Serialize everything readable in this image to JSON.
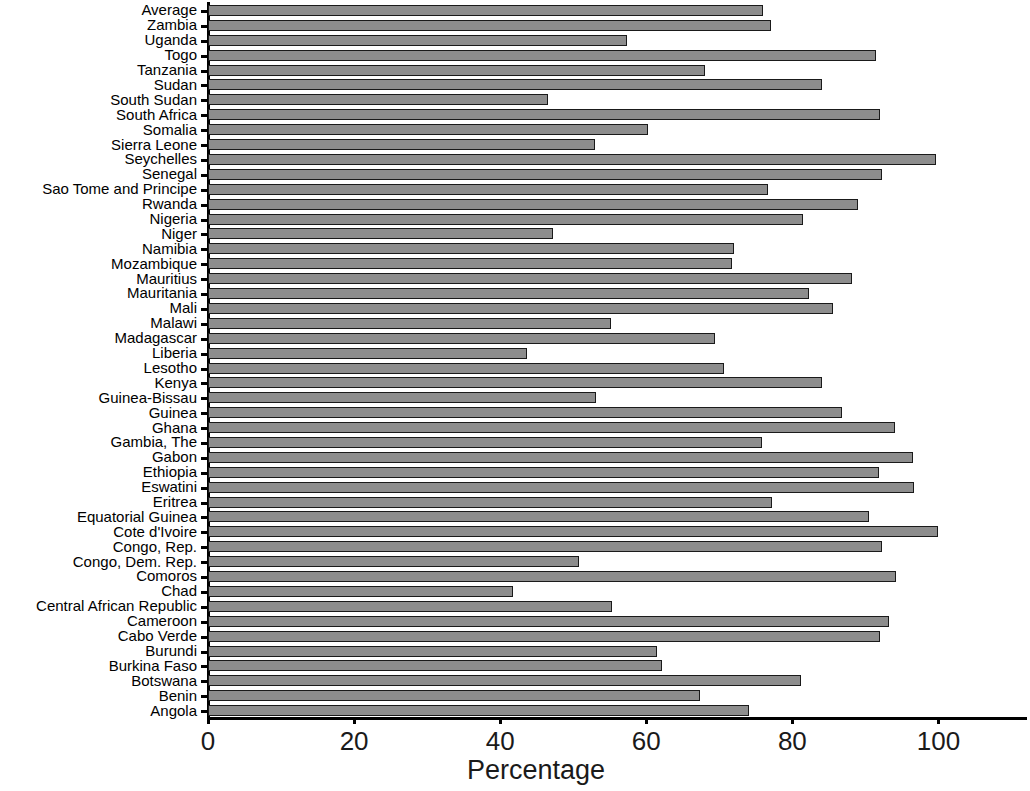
{
  "chart_data": {
    "type": "bar",
    "orientation": "horizontal",
    "title": "",
    "xlabel": "Percentage",
    "ylabel": "",
    "xlim": [
      0,
      105
    ],
    "xticks": [
      0,
      20,
      40,
      60,
      80,
      100
    ],
    "xtick_labels": [
      "0",
      "20",
      "40",
      "60",
      "80",
      "100"
    ],
    "grid": false,
    "legend": null,
    "bar_color": "#8d8d8d",
    "bar_edge_color": "#1a1a1a",
    "axis_color": "#000000",
    "background_color": "#ffffff",
    "categories": [
      "Average",
      "Zambia",
      "Uganda",
      "Togo",
      "Tanzania",
      "Sudan",
      "South Sudan",
      "South Africa",
      "Somalia",
      "Sierra Leone",
      "Seychelles",
      "Senegal",
      "Sao Tome and Principe",
      "Rwanda",
      "Nigeria",
      "Niger",
      "Namibia",
      "Mozambique",
      "Mauritius",
      "Mauritania",
      "Mali",
      "Malawi",
      "Madagascar",
      "Liberia",
      "Lesotho",
      "Kenya",
      "Guinea-Bissau",
      "Guinea",
      "Ghana",
      "Gambia, The",
      "Gabon",
      "Ethiopia",
      "Eswatini",
      "Eritrea",
      "Equatorial Guinea",
      "Cote d'Ivoire",
      "Congo, Rep.",
      "Congo, Dem. Rep.",
      "Comoros",
      "Chad",
      "Central African Republic",
      "Cameroon",
      "Cabo Verde",
      "Burundi",
      "Burkina Faso",
      "Botswana",
      "Benin",
      "Angola"
    ],
    "values": [
      76.0,
      77.1,
      57.3,
      91.5,
      68.0,
      84.0,
      46.5,
      92.0,
      60.2,
      53.0,
      99.6,
      92.3,
      76.7,
      89.0,
      81.5,
      47.2,
      72.0,
      71.8,
      88.2,
      82.3,
      85.5,
      55.2,
      69.4,
      43.7,
      70.7,
      84.0,
      53.1,
      86.8,
      94.0,
      75.8,
      96.5,
      91.8,
      96.7,
      77.2,
      90.5,
      99.9,
      92.3,
      50.8,
      94.2,
      41.8,
      55.3,
      93.2,
      92.0,
      61.5,
      62.1,
      81.2,
      67.3,
      74.0
    ]
  }
}
